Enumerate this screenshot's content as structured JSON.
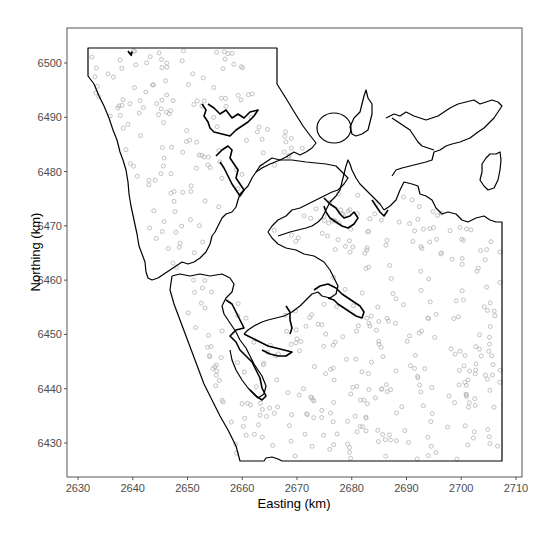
{
  "chart_data": {
    "type": "scatter",
    "title": "",
    "xlabel": "Easting (km)",
    "ylabel": "Northing (km)",
    "xlim": [
      2628,
      2711
    ],
    "ylim": [
      6423,
      6506
    ],
    "x_ticks": [
      2630,
      2640,
      2650,
      2660,
      2670,
      2680,
      2690,
      2700,
      2710
    ],
    "y_ticks": [
      6430,
      6440,
      6450,
      6460,
      6470,
      6480,
      6490,
      6500
    ],
    "grid": false,
    "legend": null,
    "layers": [
      {
        "name": "study-region-boundary",
        "kind": "polygon-outline",
        "color": "#000000"
      },
      {
        "name": "coastline",
        "kind": "polyline",
        "color": "#000000"
      },
      {
        "name": "sample-points",
        "kind": "open-circle",
        "color": "#b0b0b0",
        "approx_count": 500
      }
    ],
    "boundary_outer": [
      [
        2632,
        6502.5
      ],
      [
        2662,
        6502.5
      ],
      [
        2662,
        6496
      ],
      [
        2669,
        6489
      ],
      [
        2674,
        6484
      ],
      [
        2686,
        6478
      ],
      [
        2690,
        6475
      ],
      [
        2700,
        6473
      ],
      [
        2708,
        6470.5
      ],
      [
        2708,
        6426.5
      ],
      [
        2659.5,
        6426.5
      ],
      [
        2648,
        6460
      ],
      [
        2644.5,
        6460.5
      ],
      [
        2643,
        6468
      ],
      [
        2639.5,
        6480
      ],
      [
        2636,
        6488
      ],
      [
        2632,
        6496
      ]
    ],
    "islands": [
      {
        "name": "island-1",
        "center": [
          2682,
          6487.5
        ],
        "rx": 2.2,
        "ry": 2.0
      },
      {
        "name": "island-2",
        "center": [
          2686,
          6489
        ],
        "rx": 1.5,
        "ry": 3.0
      },
      {
        "name": "island-3",
        "center": [
          2704.5,
          6481
        ],
        "rx": 1.7,
        "ry": 3.5
      }
    ]
  },
  "axes": {
    "x_title": "Easting (km)",
    "y_title": "Northing (km)",
    "x_tick_labels": [
      "2630",
      "2640",
      "2650",
      "2660",
      "2670",
      "2680",
      "2690",
      "2700",
      "2710"
    ],
    "y_tick_labels": [
      "6430",
      "6440",
      "6450",
      "6460",
      "6470",
      "6480",
      "6490",
      "6500"
    ]
  },
  "style": {
    "point_color": "#b3b3b3",
    "line_color": "#000000",
    "panel_border": "#555555"
  }
}
